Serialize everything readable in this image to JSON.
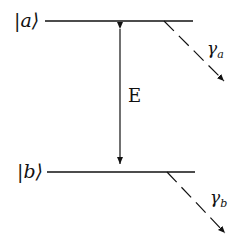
{
  "levels": {
    "upper": {
      "label": "|a⟩",
      "decay": "γ",
      "decay_sub": "a"
    },
    "lower": {
      "label": "|b⟩",
      "decay": "γ",
      "decay_sub": "b"
    }
  },
  "transition": {
    "label": "E"
  }
}
